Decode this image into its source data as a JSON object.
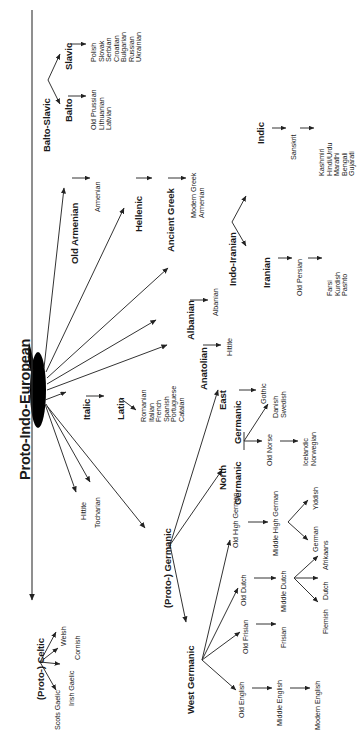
{
  "diagram": {
    "title": "Proto-Indo-European",
    "type": "language-family-tree",
    "orientation": "rotated-90-ccw",
    "root": {
      "id": "pie",
      "label": "Proto-Indo-European",
      "emphasis": "large-bold"
    },
    "nodes": {
      "balto_slavic": {
        "label": "Balto-Slavic",
        "size": "mid",
        "bold": true
      },
      "slavic": {
        "label": "Slavic",
        "size": "mid",
        "bold": true
      },
      "baltic": {
        "label": "Balto",
        "size": "mid",
        "bold": true
      },
      "old_armenian": {
        "label": "Old Armenian",
        "size": "mid",
        "bold": true
      },
      "hellenic": {
        "label": "Hellenic",
        "size": "mid",
        "bold": true
      },
      "ancient_greek": {
        "label": "Ancient Greek",
        "size": "mid",
        "bold": true
      },
      "indo_iranian": {
        "label": "Indo-Iranian",
        "size": "mid",
        "bold": true
      },
      "indic": {
        "label": "Indic",
        "size": "mid",
        "bold": true
      },
      "iranian": {
        "label": "Iranian",
        "size": "mid",
        "bold": true
      },
      "albanian_branch": {
        "label": "Albanian",
        "size": "mid",
        "bold": true
      },
      "anatolian": {
        "label": "Anatolian",
        "size": "mid",
        "bold": true
      },
      "italic": {
        "label": "Italic",
        "size": "mid",
        "bold": true
      },
      "latin": {
        "label": "Latin",
        "size": "mid",
        "bold": true
      },
      "proto_germanic": {
        "label": "(Proto-) Germanic",
        "size": "mid",
        "bold": true
      },
      "east_germanic": {
        "label": "East",
        "label2": "Germanic",
        "size": "mid",
        "bold": true
      },
      "north_germanic": {
        "label": "North",
        "label2": "Germanic",
        "size": "mid",
        "bold": true
      },
      "west_germanic": {
        "label": "West Germanic",
        "size": "mid",
        "bold": true
      },
      "proto_celtic": {
        "label": "(Proto-) Celtic",
        "size": "mid",
        "bold": true
      }
    },
    "leaves": {
      "slavic_langs": [
        "Polish",
        "Slovak",
        "Serbian",
        "Croatian",
        "Bulgarian",
        "Russian",
        "Ukrainian"
      ],
      "baltic_langs": [
        "Old Prussian",
        "Lithuanian",
        "Latvian"
      ],
      "armenian": "Armenian",
      "greek_modern": [
        "Modern Greek",
        "Armenian"
      ],
      "sanskrit": "Sanskrit",
      "indic_langs": [
        "Kashmiri",
        "Hindi/Urdu",
        "Marathi",
        "Bengali",
        "Gujarati"
      ],
      "old_persian": "Old Persian",
      "iranian_langs": [
        "Farsi",
        "Kurdish",
        "Pashto"
      ],
      "albanian": "Albanian",
      "hittite_anatolian": "Hittite",
      "romance_langs": [
        "Romanian",
        "Italian",
        "French",
        "Spanish",
        "Portuguese",
        "Catalan"
      ],
      "gothic": "Gothic",
      "old_norse": "Old Norse",
      "norse_west": [
        "Icelandic",
        "Norwegian"
      ],
      "norse_east": [
        "Danish",
        "Swedish"
      ],
      "old_high_german": "Old High German",
      "middle_high_german": "Middle High German",
      "german_yiddish": [
        "German",
        "Yiddish"
      ],
      "old_dutch": "Old Dutch",
      "middle_dutch": "Middle Dutch",
      "dutch_group": [
        "Flemish",
        "Dutch",
        "Afrikaans"
      ],
      "old_frisian": "Old Frisian",
      "frisian": "Frisian",
      "old_english": "Old English",
      "middle_english": "Middle English",
      "modern_english": "Modern English",
      "hittite_direct": "Hittite",
      "tocharian": "Tocharian",
      "celtic_langs": [
        "Welsh",
        "Cornish",
        "Irish Gaelic",
        "Scots Gaelic"
      ]
    },
    "colors": {
      "background": "#ffffff",
      "ink": "#1a1a1a",
      "line": "#333333",
      "hub": "#000000"
    }
  }
}
